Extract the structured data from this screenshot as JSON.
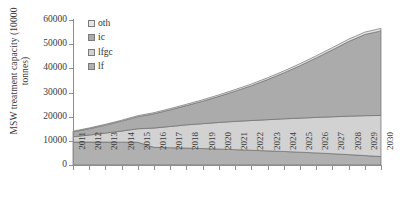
{
  "chart_data": {
    "type": "area",
    "stacked": true,
    "title": "",
    "subtitle": "",
    "xlabel": "",
    "ylabel": "MSW treatment capacity (10000 tonnes)",
    "ylabel_lines": [
      "MSW treatment capacity (10000",
      "tonnes)"
    ],
    "grid": false,
    "legend_position": "top-left inside",
    "ylim": [
      0,
      60000
    ],
    "ytick_values": [
      0,
      10000,
      20000,
      30000,
      40000,
      50000,
      60000
    ],
    "ytick_labels": [
      "0",
      "10000",
      "20000",
      "30000",
      "40000",
      "50000",
      "60000"
    ],
    "categories": [
      2011,
      2012,
      2013,
      2014,
      2015,
      2016,
      2017,
      2018,
      2019,
      2020,
      2021,
      2022,
      2023,
      2024,
      2025,
      2026,
      2027,
      2028,
      2029,
      2030
    ],
    "xtick_labels": [
      "2011",
      "2012",
      "2013",
      "2014",
      "2015",
      "2016",
      "2017",
      "2018",
      "2019",
      "2020",
      "2021",
      "2022",
      "2023",
      "2024",
      "2025",
      "2026",
      "2027",
      "2028",
      "2029",
      "2030"
    ],
    "series": [
      {
        "name": "lf",
        "legend_label": "lf",
        "stack_order": 1,
        "color": "#b0b0b0",
        "values": [
          9500,
          9500,
          9500,
          9450,
          9400,
          7300,
          7150,
          7000,
          6800,
          6600,
          6350,
          6100,
          5850,
          5600,
          5300,
          5000,
          4650,
          4300,
          3900,
          3500
        ]
      },
      {
        "name": "lfgc",
        "legend_label": "lfgc",
        "stack_order": 2,
        "color": "#d2d2d2",
        "values": [
          2200,
          2900,
          3700,
          4600,
          5600,
          8000,
          8800,
          9600,
          10300,
          11000,
          11700,
          12300,
          12900,
          13500,
          14100,
          14700,
          15300,
          15900,
          16500,
          17000
        ]
      },
      {
        "name": "ic",
        "legend_label": "ic",
        "stack_order": 3,
        "color": "#ababab",
        "values": [
          2000,
          2600,
          3300,
          4100,
          5000,
          5900,
          6900,
          8000,
          9300,
          10800,
          12500,
          14400,
          16600,
          19000,
          21700,
          24600,
          27700,
          30900,
          33600,
          35000
        ]
      },
      {
        "name": "oth",
        "legend_label": "oth",
        "stack_order": 4,
        "color": "#e6e6e6",
        "values": [
          300,
          330,
          360,
          390,
          420,
          460,
          500,
          540,
          580,
          620,
          660,
          700,
          740,
          780,
          820,
          860,
          900,
          940,
          980,
          1000
        ]
      }
    ],
    "totals": [
      14000,
      15330,
      16860,
      18540,
      20420,
      21660,
      23350,
      25140,
      26980,
      29020,
      31210,
      33500,
      36090,
      38880,
      41920,
      45160,
      48550,
      52040,
      54980,
      56500
    ]
  },
  "legend": {
    "entries": [
      {
        "label": "oth",
        "color": "#e6e6e6"
      },
      {
        "label": "ic",
        "color": "#ababab"
      },
      {
        "label": "lfgc",
        "color": "#d2d2d2"
      },
      {
        "label": "lf",
        "color": "#b0b0b0"
      }
    ]
  },
  "axes": {
    "y_title_line1": "MSW treatment capacity (10000",
    "y_title_line2": "tonnes)"
  }
}
